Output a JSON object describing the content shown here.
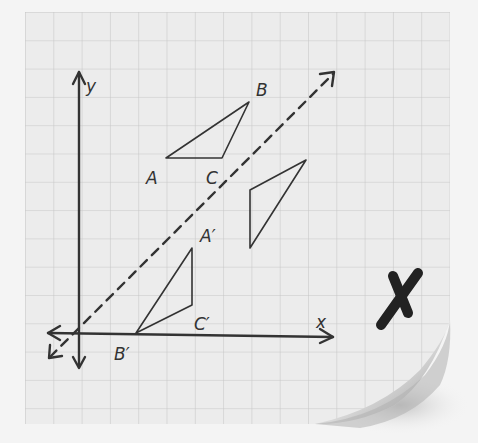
{
  "diagram": {
    "type": "coordinate-reflection-sticky-note",
    "axes": {
      "x_label": "x",
      "y_label": "y"
    },
    "triangle_original": {
      "vertices": [
        {
          "label": "A",
          "x": 166,
          "y": 158
        },
        {
          "label": "B",
          "x": 249,
          "y": 102
        },
        {
          "label": "C",
          "x": 222,
          "y": 158
        }
      ]
    },
    "triangle_image": {
      "vertices": [
        {
          "label": "A′",
          "x": 192,
          "y": 248
        },
        {
          "label": "B′",
          "x": 136,
          "y": 333
        },
        {
          "label": "C′",
          "x": 192,
          "y": 305
        }
      ]
    },
    "triangle_unlabeled": {
      "vertices": [
        {
          "x": 250,
          "y": 190
        },
        {
          "x": 306,
          "y": 160
        },
        {
          "x": 250,
          "y": 248
        }
      ]
    },
    "reflection_line": {
      "style": "dashed",
      "description": "line y = x"
    },
    "mark": {
      "symbol": "X",
      "meaning": "incorrect",
      "color": "#1e1e1e"
    },
    "colors": {
      "paper": "#ececec",
      "grid": "#c9c9c9",
      "ink": "#333333",
      "background": "#f4f4f4"
    }
  }
}
